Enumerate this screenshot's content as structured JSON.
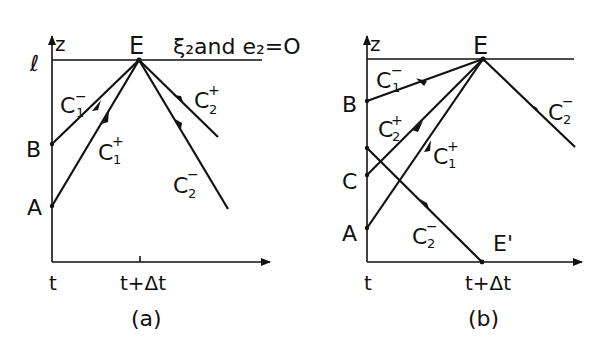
{
  "figure": {
    "panels": [
      {
        "id": "a",
        "caption": "(a)",
        "axis_y_label": "z",
        "top_level_label": "ℓ",
        "top_note": "ξ₂and e₂=O",
        "x_ticks": [
          "t",
          "t+Δt"
        ],
        "points": {
          "E": "E",
          "B": "B",
          "A": "A"
        },
        "characteristics": {
          "c1_minus": {
            "base": "C",
            "sub": "1",
            "sup": "−"
          },
          "c1_plus": {
            "base": "C",
            "sub": "1",
            "sup": "+"
          },
          "c2_plus": {
            "base": "C",
            "sub": "2",
            "sup": "+"
          },
          "c2_minus": {
            "base": "C",
            "sub": "2",
            "sup": "−"
          }
        }
      },
      {
        "id": "b",
        "caption": "(b)",
        "axis_y_label": "z",
        "x_ticks": [
          "t",
          "t+Δt"
        ],
        "points": {
          "E": "E",
          "B": "B",
          "C": "C",
          "A": "A",
          "E_prime": "E'"
        },
        "characteristics": {
          "c1_minus": {
            "base": "C",
            "sub": "1",
            "sup": "−"
          },
          "c2_plus": {
            "base": "C",
            "sub": "2",
            "sup": "+"
          },
          "c1_plus": {
            "base": "C",
            "sub": "1",
            "sup": "+"
          },
          "c2_minus_right": {
            "base": "C",
            "sub": "2",
            "sup": "−"
          },
          "c2_minus_lower": {
            "base": "C",
            "sub": "2",
            "sup": "−"
          }
        }
      }
    ]
  }
}
